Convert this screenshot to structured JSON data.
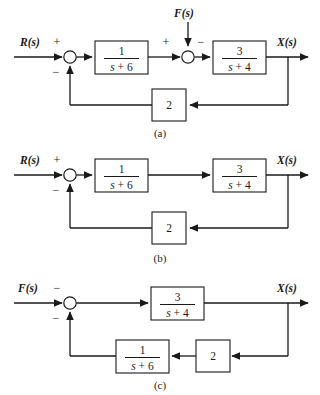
{
  "figure": {
    "type": "control-block-diagram",
    "panel_count": 3,
    "background_color": "#ffffff",
    "line_color": "#1a1a1a"
  },
  "panels": [
    {
      "id": "a",
      "caption": "(a)",
      "input_label": "R(s)",
      "input_var": "R",
      "disturbance_label": "F(s)",
      "disturbance_var": "F",
      "output_label": "X(s)",
      "output_var": "X",
      "sum1_sign_top": "+",
      "sum1_sign_bottom": "−",
      "sum2_sign_left": "+",
      "sum2_sign_right": "−",
      "block1_num": "1",
      "block1_den_var": "s",
      "block1_den_op": " + ",
      "block1_den_const": "6",
      "block2_num": "3",
      "block2_den_var": "s",
      "block2_den_op": " + ",
      "block2_den_const": "4",
      "feedback_gain": "2"
    },
    {
      "id": "b",
      "caption": "(b)",
      "input_label": "R(s)",
      "input_var": "R",
      "output_label": "X(s)",
      "output_var": "X",
      "sum1_sign_top": "+",
      "sum1_sign_bottom": "−",
      "block1_num": "1",
      "block1_den_var": "s",
      "block1_den_op": " + ",
      "block1_den_const": "6",
      "block2_num": "3",
      "block2_den_var": "s",
      "block2_den_op": " + ",
      "block2_den_const": "4",
      "feedback_gain": "2"
    },
    {
      "id": "c",
      "caption": "(c)",
      "input_label": "F(s)",
      "input_var": "F",
      "output_label": "X(s)",
      "output_var": "X",
      "sum1_sign_top": "−",
      "sum1_sign_bottom": "−",
      "forward_num": "3",
      "forward_den_var": "s",
      "forward_den_op": " + ",
      "forward_den_const": "4",
      "feedback_num": "1",
      "feedback_den_var": "s",
      "feedback_den_op": " + ",
      "feedback_den_const": "6",
      "feedback_gain": "2"
    }
  ]
}
